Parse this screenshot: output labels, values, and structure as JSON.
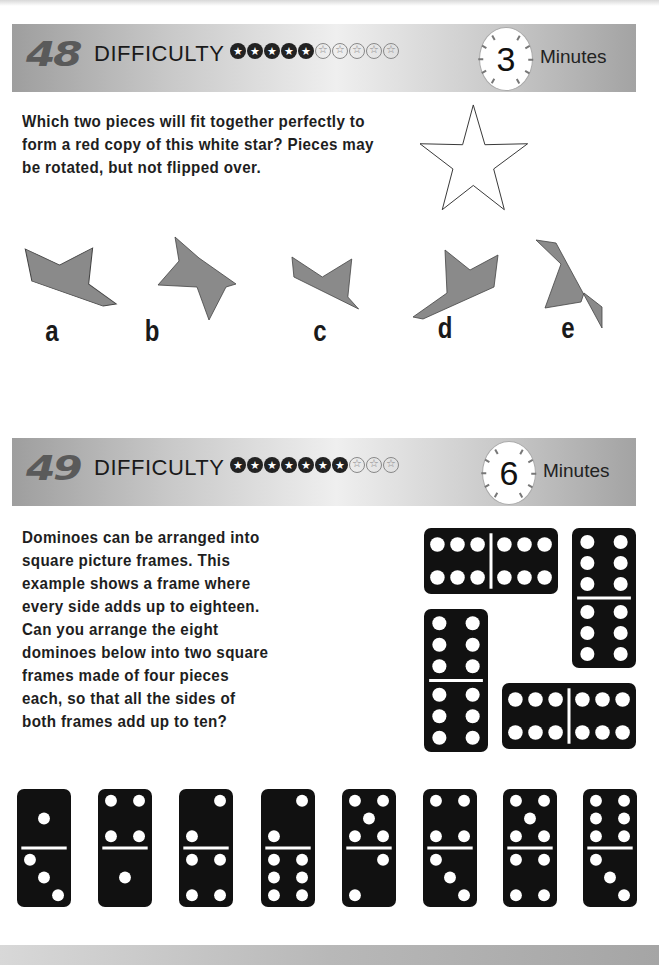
{
  "puzzles": [
    {
      "number": "48",
      "difficulty_label": "DIFFICULTY",
      "difficulty_filled": 5,
      "difficulty_total": 10,
      "timer_value": "3",
      "timer_unit": "Minutes",
      "question_lines": [
        "Which two pieces will fit together perfectly to",
        "form a red copy of this white star? Pieces may",
        "be rotated, but not flipped over."
      ],
      "piece_color": "#8a8a8a",
      "pieces": [
        {
          "label": "a"
        },
        {
          "label": "b"
        },
        {
          "label": "c"
        },
        {
          "label": "d"
        },
        {
          "label": "e"
        }
      ]
    },
    {
      "number": "49",
      "difficulty_label": "DIFFICULTY",
      "difficulty_filled": 7,
      "difficulty_total": 10,
      "timer_value": "6",
      "timer_unit": "Minutes",
      "question_lines": [
        "Dominoes can be arranged into",
        "square picture frames. This",
        "example shows a frame where",
        "every side adds up to eighteen.",
        "Can you arrange the eight",
        "dominoes below into two square",
        "frames made of four pieces",
        "each, so that all the sides of",
        "both frames add up to ten?"
      ],
      "example_frame": [
        {
          "orientation": "horizontal",
          "values": [
            6,
            6
          ]
        },
        {
          "orientation": "vertical",
          "values": [
            6,
            6
          ]
        },
        {
          "orientation": "vertical",
          "values": [
            6,
            6
          ]
        },
        {
          "orientation": "horizontal",
          "values": [
            6,
            6
          ]
        }
      ],
      "dominoes": [
        {
          "top": 1,
          "bottom": 3
        },
        {
          "top": 4,
          "bottom": 1
        },
        {
          "top": 2,
          "bottom": 4
        },
        {
          "top": 2,
          "bottom": 6
        },
        {
          "top": 5,
          "bottom": 2
        },
        {
          "top": 4,
          "bottom": 3
        },
        {
          "top": 5,
          "bottom": 4
        },
        {
          "top": 6,
          "bottom": 3
        }
      ]
    }
  ]
}
